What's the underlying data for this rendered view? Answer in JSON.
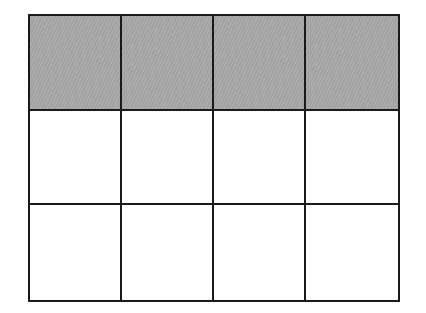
{
  "diagram": {
    "type": "fraction-grid",
    "rows": 3,
    "columns": 4,
    "total_cells": 12,
    "shaded_cells": 4,
    "shaded_row": 1,
    "shade_color": "#a9a9a9",
    "line_color": "#1a1a1a",
    "cells": [
      {
        "row": 1,
        "col": 1,
        "shaded": true
      },
      {
        "row": 1,
        "col": 2,
        "shaded": true
      },
      {
        "row": 1,
        "col": 3,
        "shaded": true
      },
      {
        "row": 1,
        "col": 4,
        "shaded": true
      },
      {
        "row": 2,
        "col": 1,
        "shaded": false
      },
      {
        "row": 2,
        "col": 2,
        "shaded": false
      },
      {
        "row": 2,
        "col": 3,
        "shaded": false
      },
      {
        "row": 2,
        "col": 4,
        "shaded": false
      },
      {
        "row": 3,
        "col": 1,
        "shaded": false
      },
      {
        "row": 3,
        "col": 2,
        "shaded": false
      },
      {
        "row": 3,
        "col": 3,
        "shaded": false
      },
      {
        "row": 3,
        "col": 4,
        "shaded": false
      }
    ]
  }
}
